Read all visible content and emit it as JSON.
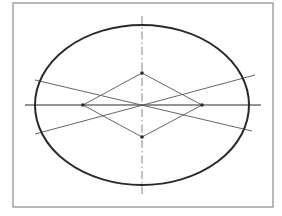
{
  "diagram": {
    "type": "four-center-oval-construction",
    "colors": {
      "background": "#ffffff",
      "frame": "#8a8a8a",
      "oval": "#2a2a2a",
      "construction": "#555555",
      "centerline": "#777777"
    },
    "frame": {
      "x": 13,
      "y": 3,
      "width": 260,
      "height": 204
    },
    "oval": {
      "cx": 142,
      "cy": 105,
      "rx": 107,
      "ry": 80
    },
    "major_axis": {
      "x1": 25,
      "y1": 105,
      "x2": 261,
      "y2": 105
    },
    "minor_axis": {
      "x1": 142,
      "y1": 16,
      "x2": 142,
      "y2": 194
    },
    "rhombus": {
      "top": [
        142,
        73
      ],
      "right": [
        202,
        105
      ],
      "bottom": [
        142,
        137
      ],
      "left": [
        83,
        105
      ]
    },
    "diagonals": [
      {
        "x1": 35,
        "y1": 80,
        "x2": 252,
        "y2": 131
      },
      {
        "x1": 35,
        "y1": 134,
        "x2": 255,
        "y2": 75
      }
    ],
    "centers": [
      [
        142,
        73
      ],
      [
        142,
        137
      ],
      [
        83,
        105
      ],
      [
        202,
        105
      ]
    ]
  }
}
